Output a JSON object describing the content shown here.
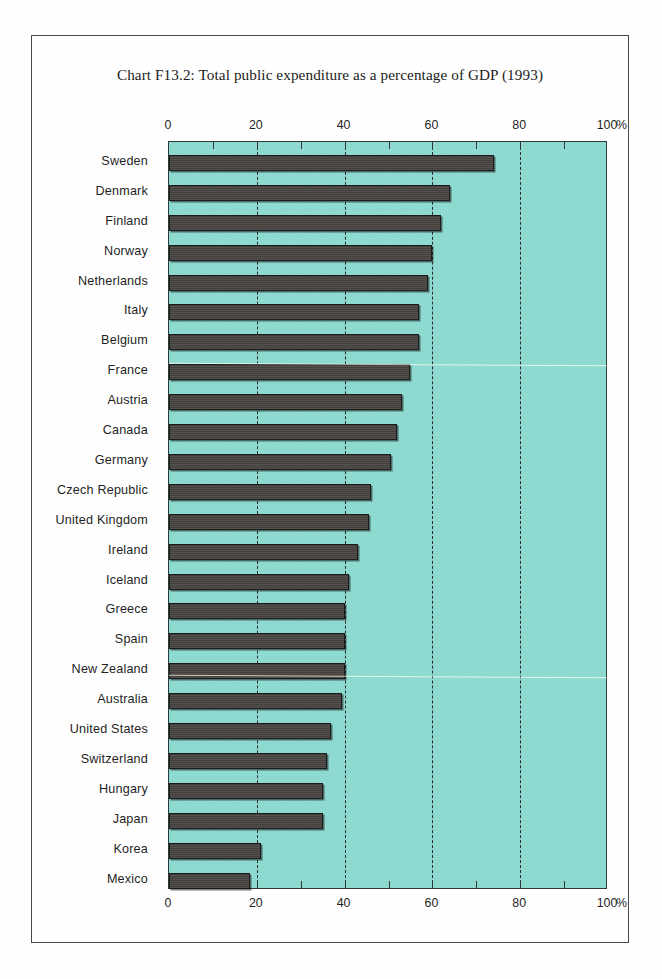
{
  "title": "Chart F13.2: Total public expenditure as a percentage of GDP (1993)",
  "axis": {
    "unit": "%",
    "ticks": [
      "0",
      "20",
      "40",
      "60",
      "80",
      "100"
    ]
  },
  "colors": {
    "plot_background": "#85d7cd",
    "bar_fill": "#474442",
    "frame": "#3c3c3c",
    "gridline": "#2a2a2a"
  },
  "chart_data": {
    "type": "bar",
    "orientation": "horizontal",
    "title": "Chart F13.2: Total public expenditure as a percentage of GDP (1993)",
    "xlabel": "%",
    "ylabel": "",
    "xlim": [
      0,
      100
    ],
    "xticks": [
      0,
      20,
      40,
      60,
      80,
      100
    ],
    "minor_tick_interval": 10,
    "grid": "dashed vertical gridlines at 20, 40, 60, 80",
    "legend": "none",
    "categories": [
      "Sweden",
      "Denmark",
      "Finland",
      "Norway",
      "Netherlands",
      "Italy",
      "Belgium",
      "France",
      "Austria",
      "Canada",
      "Germany",
      "Czech Republic",
      "United Kingdom",
      "Ireland",
      "Iceland",
      "Greece",
      "Spain",
      "New Zealand",
      "Australia",
      "United States",
      "Switzerland",
      "Hungary",
      "Japan",
      "Korea",
      "Mexico"
    ],
    "values": [
      74,
      64,
      62,
      60,
      59,
      57,
      57,
      55,
      53,
      52,
      50.5,
      46,
      45.5,
      43,
      41,
      40,
      40,
      40,
      39.5,
      37,
      36,
      35,
      35,
      21,
      18.5
    ],
    "series": [
      {
        "name": "Total public expenditure as a percentage of GDP (1993)",
        "values": [
          74,
          64,
          62,
          60,
          59,
          57,
          57,
          55,
          53,
          52,
          50.5,
          46,
          45.5,
          43,
          41,
          40,
          40,
          40,
          39.5,
          37,
          36,
          35,
          35,
          21,
          18.5
        ]
      }
    ]
  }
}
